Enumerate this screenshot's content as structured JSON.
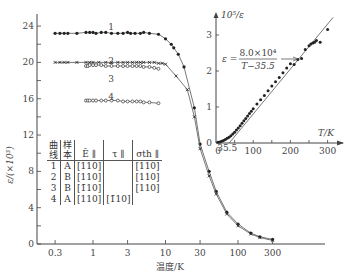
{
  "chart_data": [
    {
      "type": "scatter",
      "title": "",
      "xlabel": "温度/K",
      "ylabel": "ε/(×10³)",
      "xscale": "log",
      "xlim": [
        0.25,
        500
      ],
      "ylim": [
        0,
        25
      ],
      "xticks": [
        "0.3",
        "1",
        "3",
        "10",
        "30",
        "100",
        "300"
      ],
      "yticks": [
        "0",
        "4",
        "8",
        "12",
        "16",
        "20",
        "24"
      ],
      "grid": false,
      "series": [
        {
          "name": "1",
          "marker": "filled",
          "x": [
            0.3,
            0.35,
            0.4,
            0.45,
            0.6,
            0.8,
            0.9,
            1.0,
            1.1,
            1.3,
            1.5,
            1.8,
            2.2,
            2.6,
            3.0,
            3.3,
            3.8,
            4.5,
            5,
            6,
            8,
            10,
            12,
            13,
            15,
            18,
            25,
            30,
            40,
            50,
            70,
            100,
            150,
            200,
            300
          ],
          "y": [
            23.2,
            23.2,
            23.2,
            23.2,
            23.2,
            23.3,
            23.3,
            23.3,
            23.2,
            23.3,
            23.3,
            23.2,
            23.2,
            23.2,
            23.3,
            23.2,
            23.2,
            23.2,
            23.3,
            23.2,
            23.1,
            22.6,
            22.0,
            21.6,
            20.9,
            19.5,
            15.0,
            11.0,
            8.0,
            5.8,
            3.5,
            2.2,
            1.2,
            0.8,
            0.5
          ]
        },
        {
          "name": "2",
          "marker": "cross",
          "x": [
            0.3,
            0.35,
            0.4,
            0.45,
            0.6,
            0.8,
            0.9,
            1.0,
            1.2,
            1.5,
            1.8,
            2.2,
            2.6,
            3.0,
            3.5,
            4.0,
            4.5,
            5,
            6,
            7,
            8,
            9,
            10,
            14,
            20,
            25,
            30,
            40,
            50,
            70,
            100,
            150,
            200,
            300
          ],
          "y": [
            20.0,
            20.0,
            20.0,
            20.0,
            20.0,
            20.0,
            20.0,
            20.0,
            20.0,
            20.0,
            20.0,
            20.0,
            20.0,
            20.0,
            20.0,
            20.0,
            20.0,
            20.0,
            20.0,
            20.0,
            19.9,
            19.9,
            19.8,
            18.5,
            17.0,
            14.0,
            10.5,
            7.5,
            5.5,
            3.3,
            2.0,
            1.1,
            0.7,
            0.4
          ]
        },
        {
          "name": "3",
          "marker": "open",
          "x": [
            0.8,
            0.85,
            0.9,
            1.0,
            1.1,
            1.3,
            1.5,
            1.8,
            2.2,
            2.6,
            3.0,
            3.5,
            4.0,
            4.5,
            5,
            6,
            7,
            8
          ],
          "y": [
            19.6,
            19.6,
            19.7,
            19.7,
            19.7,
            19.7,
            19.6,
            19.6,
            19.6,
            19.6,
            19.6,
            19.6,
            19.6,
            19.6,
            19.5,
            19.5,
            19.4,
            19.3
          ]
        },
        {
          "name": "4",
          "marker": "open",
          "x": [
            0.8,
            0.85,
            0.9,
            1.0,
            1.1,
            1.3,
            1.5,
            1.8,
            2.2,
            2.6,
            3.0,
            3.5,
            4.0,
            4.5,
            5,
            6,
            8
          ],
          "y": [
            15.8,
            15.8,
            15.8,
            15.8,
            15.8,
            15.8,
            15.8,
            15.8,
            15.8,
            15.7,
            15.7,
            15.7,
            15.7,
            15.7,
            15.6,
            15.6,
            15.5
          ]
        }
      ],
      "annotations": [
        "1",
        "2",
        "3",
        "4"
      ],
      "table": {
        "headers": [
          "曲线",
          "样本",
          "Ē ∥",
          "τ ∥",
          "σth ∥"
        ],
        "rows": [
          [
            "1",
            "A",
            "[110]",
            "",
            "[110]"
          ],
          [
            "2",
            "B",
            "[110]",
            "",
            "[110]"
          ],
          [
            "3",
            "B",
            "[1̄10]",
            "",
            "[110]"
          ],
          [
            "4",
            "A",
            "[110]",
            "[1̄10]",
            ""
          ]
        ]
      }
    },
    {
      "type": "scatter",
      "title": "inset",
      "xlabel": "T/K",
      "ylabel": "10⁵/ε",
      "xlim": [
        0,
        340
      ],
      "ylim": [
        0,
        3.4
      ],
      "xticks": [
        "0",
        "35.5",
        "100",
        "200",
        "300"
      ],
      "yticks": [
        "0",
        "1",
        "2",
        "3"
      ],
      "fit_label": "ε = 8.0×10⁴ / (T−35.5)",
      "series": [
        {
          "name": "data",
          "marker": "filled",
          "x": [
            5,
            10,
            15,
            20,
            25,
            30,
            35,
            40,
            45,
            50,
            55,
            60,
            65,
            70,
            75,
            80,
            85,
            90,
            95,
            100,
            110,
            120,
            130,
            140,
            150,
            160,
            170,
            180,
            190,
            200,
            210,
            220,
            230,
            240,
            250,
            255,
            260,
            265,
            270,
            280,
            300
          ],
          "y": [
            0.02,
            0.03,
            0.05,
            0.07,
            0.1,
            0.13,
            0.16,
            0.2,
            0.25,
            0.3,
            0.36,
            0.42,
            0.48,
            0.55,
            0.62,
            0.68,
            0.75,
            0.82,
            0.88,
            0.95,
            1.08,
            1.2,
            1.32,
            1.45,
            1.58,
            1.7,
            1.82,
            1.95,
            2.08,
            2.2,
            2.18,
            2.32,
            2.35,
            2.6,
            2.7,
            2.75,
            2.78,
            2.8,
            2.85,
            2.8,
            3.15
          ]
        },
        {
          "name": "fit",
          "marker": "line",
          "x": [
            35.5,
            315
          ],
          "y": [
            0,
            3.49
          ]
        }
      ]
    }
  ],
  "labels": {
    "main_ylabel": "ε/(×10³)",
    "main_xlabel": "温度/K",
    "inset_ylabel": "10⁵/ε",
    "inset_xlabel": "T/K",
    "fit_lhs": "ε =",
    "fit_num": "8.0×10⁴",
    "fit_den": "T−35.5",
    "curve_labels": [
      "1",
      "2",
      "3",
      "4"
    ]
  },
  "table": {
    "h0a": "曲",
    "h0b": "线",
    "h1a": "样",
    "h1b": "本",
    "h2": "Ē ∥",
    "h3": "τ ∥",
    "h4": "σth ∥",
    "rows": [
      {
        "c0": "1",
        "c1": "A",
        "c2": "[110]",
        "c3": "",
        "c4": "[110]"
      },
      {
        "c0": "2",
        "c1": "B",
        "c2": "[110]",
        "c3": "",
        "c4": "[110]"
      },
      {
        "c0": "3",
        "c1": "B",
        "c2": "[1̄10]",
        "c3": "",
        "c4": "[110]"
      },
      {
        "c0": "4",
        "c1": "A",
        "c2": "[110]",
        "c3": "[1̄10]",
        "c4": ""
      }
    ]
  }
}
